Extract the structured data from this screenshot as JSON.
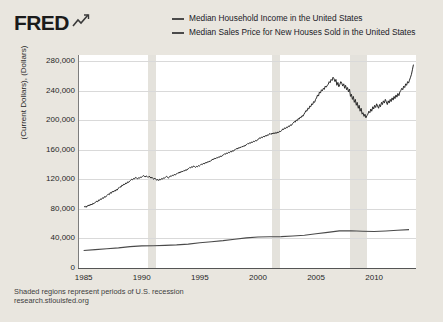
{
  "brand": {
    "logo_text": "FRED",
    "logo_icon": "swoosh-chart-icon"
  },
  "legend": {
    "position": "top-right",
    "entries": [
      {
        "label": "Median Household Income in the United States",
        "color": "#4a4a4a"
      },
      {
        "label": "Median Sales Price for New Houses Sold in the United States",
        "color": "#4a4a4a"
      }
    ]
  },
  "footer": {
    "note": "Shaded regions represent periods of U.S. recession",
    "url": "research.stlouisfed.org"
  },
  "chart_data": {
    "type": "line",
    "title": "",
    "xlabel": "",
    "ylabel": "(Current Dollars), (Dollars)",
    "xlim": [
      1984.6,
      2013.6
    ],
    "ylim": [
      0,
      288000
    ],
    "grid": true,
    "background": "#ffffff",
    "page_background": "#e9e6df",
    "yticks": [
      0,
      40000,
      80000,
      120000,
      160000,
      200000,
      240000,
      280000
    ],
    "ytick_labels": [
      "0",
      "40,000",
      "80,000",
      "120,000",
      "160,000",
      "200,000",
      "240,000",
      "280,000"
    ],
    "xticks": [
      1985,
      1990,
      1995,
      2000,
      2005,
      2010
    ],
    "xtick_labels": [
      "1985",
      "1990",
      "1995",
      "2000",
      "2005",
      "2010"
    ],
    "recession_bands": [
      {
        "start": 1990.5,
        "end": 1991.2,
        "color": "#e4e2dc"
      },
      {
        "start": 2001.2,
        "end": 2001.9,
        "color": "#e4e2dc"
      },
      {
        "start": 2007.9,
        "end": 2009.4,
        "color": "#e4e2dc"
      }
    ],
    "series": [
      {
        "name": "Median Household Income in the United States",
        "color": "#4a4a4a",
        "width": 1.1,
        "units": "Current Dollars",
        "frequency": "Annual",
        "x": [
          1985,
          1986,
          1987,
          1988,
          1989,
          1990,
          1991,
          1992,
          1993,
          1994,
          1995,
          1996,
          1997,
          1998,
          1999,
          2000,
          2001,
          2002,
          2003,
          2004,
          2005,
          2006,
          2007,
          2008,
          2009,
          2010,
          2011,
          2012,
          2013
        ],
        "values": [
          23618,
          24897,
          26061,
          27225,
          28906,
          29943,
          30126,
          30636,
          31241,
          32264,
          34076,
          35492,
          37005,
          38885,
          40696,
          41990,
          42228,
          42409,
          43318,
          44334,
          46326,
          48201,
          50233,
          50303,
          49777,
          49276,
          50054,
          51017,
          51939
        ]
      },
      {
        "name": "Median Sales Price for New Houses Sold in the United States",
        "color": "#2a2a2a",
        "width": 1.0,
        "units": "Dollars",
        "frequency": "Monthly",
        "x": [
          1985.04,
          1985.13,
          1985.21,
          1985.29,
          1985.38,
          1985.46,
          1985.54,
          1985.63,
          1985.71,
          1985.79,
          1985.88,
          1985.96,
          1986.04,
          1986.13,
          1986.21,
          1986.29,
          1986.38,
          1986.46,
          1986.54,
          1986.63,
          1986.71,
          1986.79,
          1986.88,
          1986.96,
          1987.04,
          1987.13,
          1987.21,
          1987.29,
          1987.38,
          1987.46,
          1987.54,
          1987.63,
          1987.71,
          1987.79,
          1987.88,
          1987.96,
          1988.04,
          1988.13,
          1988.21,
          1988.29,
          1988.38,
          1988.46,
          1988.54,
          1988.63,
          1988.71,
          1988.79,
          1988.88,
          1988.96,
          1989.04,
          1989.13,
          1989.21,
          1989.29,
          1989.38,
          1989.46,
          1989.54,
          1989.63,
          1989.71,
          1989.79,
          1989.88,
          1989.96,
          1990.04,
          1990.13,
          1990.21,
          1990.29,
          1990.38,
          1990.46,
          1990.54,
          1990.63,
          1990.71,
          1990.79,
          1990.88,
          1990.96,
          1991.04,
          1991.13,
          1991.21,
          1991.29,
          1991.38,
          1991.46,
          1991.54,
          1991.63,
          1991.71,
          1991.79,
          1991.88,
          1991.96,
          1992.04,
          1992.13,
          1992.21,
          1992.29,
          1992.38,
          1992.46,
          1992.54,
          1992.63,
          1992.71,
          1992.79,
          1992.88,
          1992.96,
          1993.04,
          1993.13,
          1993.21,
          1993.29,
          1993.38,
          1993.46,
          1993.54,
          1993.63,
          1993.71,
          1993.79,
          1993.88,
          1993.96,
          1994.04,
          1994.13,
          1994.21,
          1994.29,
          1994.38,
          1994.46,
          1994.54,
          1994.63,
          1994.71,
          1994.79,
          1994.88,
          1994.96,
          1995.04,
          1995.13,
          1995.21,
          1995.29,
          1995.38,
          1995.46,
          1995.54,
          1995.63,
          1995.71,
          1995.79,
          1995.88,
          1995.96,
          1996.04,
          1996.13,
          1996.21,
          1996.29,
          1996.38,
          1996.46,
          1996.54,
          1996.63,
          1996.71,
          1996.79,
          1996.88,
          1996.96,
          1997.04,
          1997.13,
          1997.21,
          1997.29,
          1997.38,
          1997.46,
          1997.54,
          1997.63,
          1997.71,
          1997.79,
          1997.88,
          1997.96,
          1998.04,
          1998.13,
          1998.21,
          1998.29,
          1998.38,
          1998.46,
          1998.54,
          1998.63,
          1998.71,
          1998.79,
          1998.88,
          1998.96,
          1999.04,
          1999.13,
          1999.21,
          1999.29,
          1999.38,
          1999.46,
          1999.54,
          1999.63,
          1999.71,
          1999.79,
          1999.88,
          1999.96,
          2000.04,
          2000.13,
          2000.21,
          2000.29,
          2000.38,
          2000.46,
          2000.54,
          2000.63,
          2000.71,
          2000.79,
          2000.88,
          2000.96,
          2001.04,
          2001.13,
          2001.21,
          2001.29,
          2001.38,
          2001.46,
          2001.54,
          2001.63,
          2001.71,
          2001.79,
          2001.88,
          2001.96,
          2002.04,
          2002.13,
          2002.21,
          2002.29,
          2002.38,
          2002.46,
          2002.54,
          2002.63,
          2002.71,
          2002.79,
          2002.88,
          2002.96,
          2003.04,
          2003.13,
          2003.21,
          2003.29,
          2003.38,
          2003.46,
          2003.54,
          2003.63,
          2003.71,
          2003.79,
          2003.88,
          2003.96,
          2004.04,
          2004.13,
          2004.21,
          2004.29,
          2004.38,
          2004.46,
          2004.54,
          2004.63,
          2004.71,
          2004.79,
          2004.88,
          2004.96,
          2005.04,
          2005.13,
          2005.21,
          2005.29,
          2005.38,
          2005.46,
          2005.54,
          2005.63,
          2005.71,
          2005.79,
          2005.88,
          2005.96,
          2006.04,
          2006.13,
          2006.21,
          2006.29,
          2006.38,
          2006.46,
          2006.54,
          2006.63,
          2006.71,
          2006.79,
          2006.88,
          2006.96,
          2007.04,
          2007.13,
          2007.21,
          2007.29,
          2007.38,
          2007.46,
          2007.54,
          2007.63,
          2007.71,
          2007.79,
          2007.88,
          2007.96,
          2008.04,
          2008.13,
          2008.21,
          2008.29,
          2008.38,
          2008.46,
          2008.54,
          2008.63,
          2008.71,
          2008.79,
          2008.88,
          2008.96,
          2009.04,
          2009.13,
          2009.21,
          2009.29,
          2009.38,
          2009.46,
          2009.54,
          2009.63,
          2009.71,
          2009.79,
          2009.88,
          2009.96,
          2010.04,
          2010.13,
          2010.21,
          2010.29,
          2010.38,
          2010.46,
          2010.54,
          2010.63,
          2010.71,
          2010.79,
          2010.88,
          2010.96,
          2011.04,
          2011.13,
          2011.21,
          2011.29,
          2011.38,
          2011.46,
          2011.54,
          2011.63,
          2011.71,
          2011.79,
          2011.88,
          2011.96,
          2012.04,
          2012.13,
          2012.21,
          2012.29,
          2012.38,
          2012.46,
          2012.54,
          2012.63,
          2012.71,
          2012.79,
          2012.88,
          2012.96,
          2013.04,
          2013.13,
          2013.21,
          2013.29,
          2013.38
        ],
        "values": [
          82500,
          83500,
          82000,
          84000,
          83800,
          85500,
          84300,
          86500,
          85200,
          87500,
          86800,
          88500,
          89000,
          90500,
          89500,
          92000,
          91500,
          93500,
          92800,
          95000,
          94200,
          96500,
          95800,
          97500,
          98500,
          100000,
          99200,
          102000,
          101000,
          103500,
          102800,
          104500,
          103800,
          106000,
          105200,
          107500,
          108500,
          110000,
          109200,
          112000,
          111500,
          113500,
          112800,
          115000,
          114200,
          116500,
          115800,
          117500,
          118500,
          120000,
          119200,
          121000,
          120500,
          122500,
          121800,
          120500,
          122000,
          121200,
          123000,
          122500,
          123500,
          125000,
          124200,
          123000,
          124500,
          123800,
          122500,
          124000,
          123200,
          121500,
          122800,
          121000,
          120000,
          121500,
          120200,
          118500,
          119800,
          118200,
          120000,
          119200,
          121000,
          120200,
          122000,
          121500,
          122500,
          124000,
          123200,
          121500,
          122800,
          124500,
          123800,
          125500,
          124800,
          126500,
          125800,
          127000,
          127500,
          129000,
          128200,
          130000,
          129200,
          131000,
          130200,
          132000,
          131200,
          133000,
          132200,
          134000,
          134500,
          136000,
          135200,
          137000,
          136200,
          138000,
          137200,
          136000,
          137500,
          136800,
          138500,
          137800,
          139000,
          140500,
          139800,
          141500,
          140800,
          142500,
          141800,
          143500,
          142800,
          144500,
          143800,
          145500,
          146000,
          147500,
          146800,
          148500,
          147800,
          149500,
          148800,
          150500,
          149800,
          151500,
          150800,
          152500,
          153000,
          154500,
          153800,
          155500,
          154800,
          156500,
          155800,
          157500,
          156800,
          158500,
          157800,
          159500,
          160000,
          161500,
          160800,
          162500,
          161800,
          163500,
          162800,
          164500,
          163800,
          165500,
          164800,
          166500,
          167000,
          168500,
          167800,
          169500,
          168800,
          170500,
          169800,
          171500,
          170800,
          172500,
          171800,
          173500,
          174000,
          176000,
          175200,
          177000,
          176200,
          178000,
          177200,
          179000,
          178200,
          180000,
          179200,
          181000,
          182000,
          180500,
          182500,
          181200,
          183000,
          181500,
          183500,
          182200,
          184000,
          183200,
          185000,
          184500,
          186000,
          188000,
          187200,
          189500,
          188500,
          190500,
          189800,
          192000,
          191200,
          193500,
          192800,
          195000,
          196000,
          198000,
          197200,
          200000,
          199200,
          202000,
          201200,
          204000,
          203200,
          206000,
          205200,
          208000,
          210000,
          213000,
          212000,
          216000,
          215000,
          219000,
          218000,
          222000,
          221000,
          225000,
          224000,
          228000,
          230000,
          234000,
          232500,
          238000,
          236500,
          241000,
          239500,
          243000,
          241500,
          246000,
          244500,
          247000,
          248000,
          252000,
          250500,
          255000,
          253500,
          258000,
          256000,
          252000,
          255000,
          247000,
          251000,
          245000,
          248000,
          252000,
          250000,
          246000,
          249000,
          243000,
          247000,
          241000,
          244000,
          238000,
          242000,
          232000,
          235000,
          228000,
          232000,
          224000,
          228000,
          220000,
          224000,
          216000,
          220000,
          212000,
          216000,
          208000,
          210000,
          205000,
          208000,
          203000,
          206000,
          208000,
          212000,
          210000,
          215000,
          212000,
          218000,
          215000,
          220000,
          217000,
          222000,
          219000,
          216000,
          221000,
          218000,
          224000,
          221000,
          226000,
          223000,
          228000,
          225000,
          221000,
          226000,
          223000,
          228000,
          225000,
          230000,
          227000,
          232000,
          229000,
          234000,
          231000,
          236000,
          233000,
          238000,
          240000,
          243000,
          241000,
          246000,
          244000,
          249000,
          247000,
          252000,
          250000,
          254000,
          258000,
          262000,
          268000,
          275000
        ]
      }
    ]
  }
}
